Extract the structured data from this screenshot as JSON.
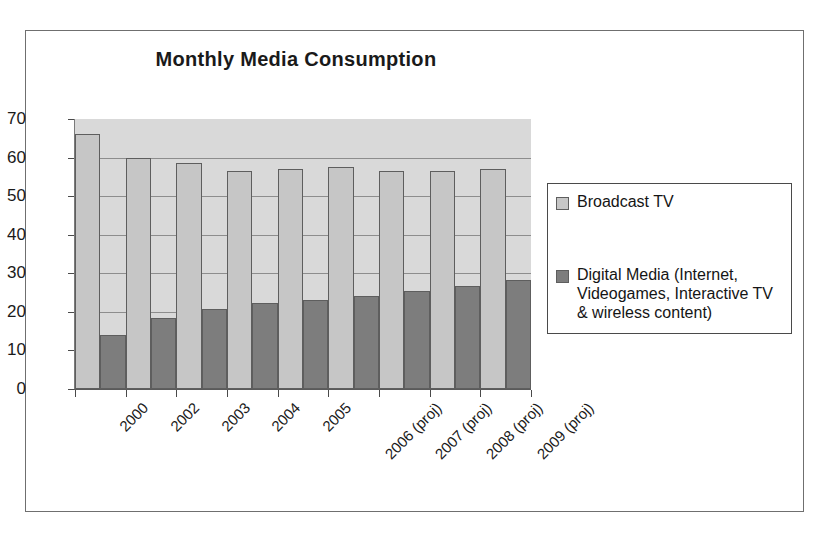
{
  "chart_data": {
    "type": "bar",
    "title": "Monthly Media Consumption",
    "xlabel": "",
    "ylabel": "",
    "ylim": [
      0,
      70
    ],
    "yticks": [
      0,
      10,
      20,
      30,
      40,
      50,
      60,
      70
    ],
    "grid": true,
    "legend_position": "right",
    "categories": [
      "2000",
      "2002",
      "2003",
      "2004",
      "2005",
      "2006 (proj)",
      "2007 (proj)",
      "2008 (proj)",
      "2009 (proj)"
    ],
    "series": [
      {
        "name": "Broadcast TV",
        "color": "#c6c6c6",
        "values": [
          66,
          60,
          58.5,
          56.5,
          57,
          57.5,
          56.5,
          56.5,
          57
        ]
      },
      {
        "name": "Digital Media (Internet, Videogames, Interactive TV & wireless content)",
        "color": "#7d7d7d",
        "values": [
          14,
          18.5,
          20.8,
          22.2,
          23.2,
          24.2,
          25.3,
          26.8,
          28.2
        ]
      }
    ]
  },
  "legend": {
    "entries": [
      "Broadcast TV",
      "Digital Media (Internet, Videogames, Interactive TV & wireless content)"
    ]
  },
  "colors": {
    "broadcast_tv": "#c6c6c6",
    "digital_media": "#7d7d7d",
    "plot_background": "#d9d9d9",
    "frame_border": "#6f6f6f"
  }
}
